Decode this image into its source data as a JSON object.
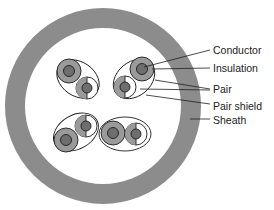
{
  "diagram": {
    "labels": [
      {
        "id": "conductor",
        "text": "Conductor",
        "x": 213,
        "y": 45
      },
      {
        "id": "insulation",
        "text": "Insulation",
        "x": 213,
        "y": 63
      },
      {
        "id": "pair",
        "text": "Pair",
        "x": 213,
        "y": 84
      },
      {
        "id": "pair-shield",
        "text": "Pair shield",
        "x": 213,
        "y": 101
      },
      {
        "id": "sheath",
        "text": "Sheath",
        "x": 213,
        "y": 115
      }
    ],
    "colors": {
      "sheath": "#8c8c8c",
      "insulation": "#9a9a9a",
      "conductor": "#6e6e6e",
      "outline": "#1e1e1e",
      "background": "#ffffff"
    },
    "pair_count": 4
  }
}
